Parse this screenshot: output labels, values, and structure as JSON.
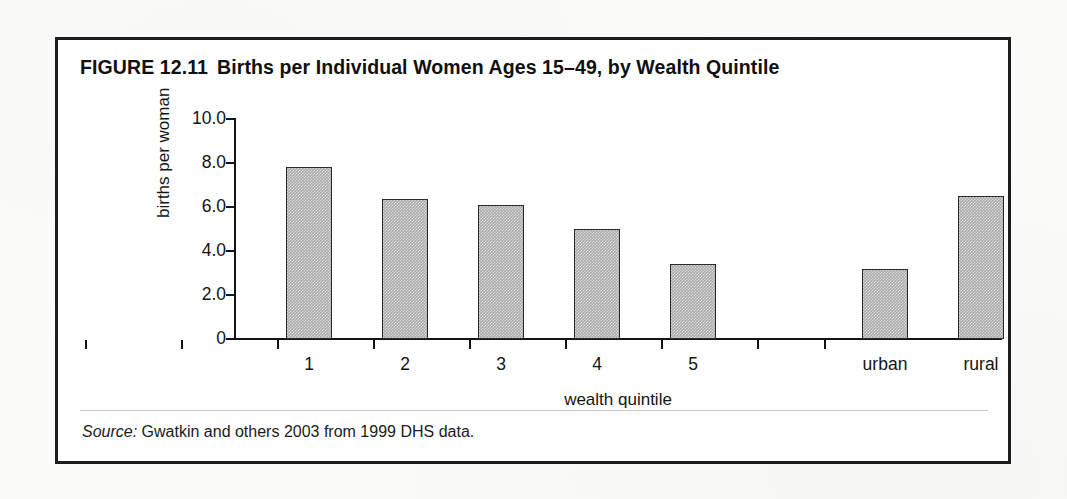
{
  "figure": {
    "number": "FIGURE 12.11",
    "title": "Births per Individual Women Ages 15–49, by Wealth Quintile",
    "source_word": "Source:",
    "source_text": " Gwatkin and others 2003 from 1999 DHS data."
  },
  "chart_data": {
    "type": "bar",
    "xlabel": "wealth quintile",
    "ylabel": "births per woman",
    "categories": [
      "1",
      "2",
      "3",
      "4",
      "5",
      "",
      "urban",
      "rural"
    ],
    "values": [
      7.8,
      6.35,
      6.1,
      5.0,
      3.4,
      null,
      3.2,
      6.5
    ],
    "ylim": [
      0,
      10
    ],
    "ytick_labels": [
      "0",
      "2.0",
      "4.0",
      "6.0",
      "8.0",
      "10.0"
    ],
    "ytick_values": [
      0,
      2,
      4,
      6,
      8,
      10
    ],
    "grid": false,
    "legend": false,
    "bar_color": "#a9a9a9",
    "bar_edge_color": "#2a2a2a",
    "axis_color": "#141414",
    "frame_color": "#1d1d1d",
    "background": "#ffffff"
  }
}
